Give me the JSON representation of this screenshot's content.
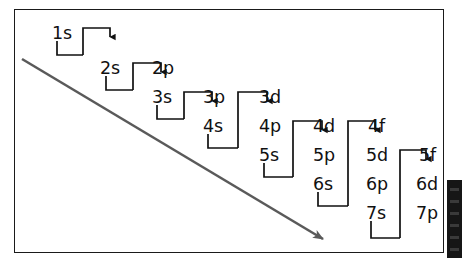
{
  "figure": {
    "kind": "aufbau-diagonal-rule-diagram",
    "frame": {
      "border_color": "#1a1a1a"
    },
    "background": "#ffffff",
    "diagonal_arrow": {
      "label": "order-of-filling-arrow",
      "color": "#5a5a5a",
      "start": [
        22,
        60
      ],
      "end": [
        330,
        243
      ]
    },
    "edge_bar": {
      "color": "#161616"
    }
  },
  "columns": [
    {
      "name": "diagonal-1",
      "x": 52,
      "top_y": 33,
      "orbitals": [
        "1s"
      ]
    },
    {
      "name": "diagonal-2",
      "x": 100,
      "top_y": 68,
      "orbitals": [
        "2s"
      ]
    },
    {
      "name": "diagonal-3",
      "x": 152,
      "top_y": 68,
      "orbitals": [
        "2p",
        "3s"
      ]
    },
    {
      "name": "diagonal-4",
      "x": 203,
      "top_y": 97,
      "orbitals": [
        "3p",
        "4s"
      ]
    },
    {
      "name": "diagonal-5",
      "x": 259,
      "top_y": 97,
      "orbitals": [
        "3d",
        "4p",
        "5s"
      ]
    },
    {
      "name": "diagonal-6",
      "x": 313,
      "top_y": 126,
      "orbitals": [
        "4d",
        "5p",
        "6s"
      ]
    },
    {
      "name": "diagonal-7",
      "x": 366,
      "top_y": 126,
      "orbitals": [
        "4f",
        "5d",
        "6p",
        "7s"
      ]
    },
    {
      "name": "diagonal-8",
      "x": 416,
      "top_y": 155,
      "orbitals": [
        "5f",
        "6d",
        "7p"
      ]
    }
  ],
  "orbital_labels": [
    {
      "id": "orb-1s",
      "text": "1s",
      "x": 52,
      "y": 33
    },
    {
      "id": "orb-2s",
      "text": "2s",
      "x": 100,
      "y": 68
    },
    {
      "id": "orb-2p",
      "text": "2p",
      "x": 152,
      "y": 68
    },
    {
      "id": "orb-3s",
      "text": "3s",
      "x": 152,
      "y": 97
    },
    {
      "id": "orb-3p",
      "text": "3p",
      "x": 203,
      "y": 97
    },
    {
      "id": "orb-4s",
      "text": "4s",
      "x": 203,
      "y": 126
    },
    {
      "id": "orb-3d",
      "text": "3d",
      "x": 259,
      "y": 97
    },
    {
      "id": "orb-4p",
      "text": "4p",
      "x": 259,
      "y": 126
    },
    {
      "id": "orb-5s",
      "text": "5s",
      "x": 259,
      "y": 155
    },
    {
      "id": "orb-4d",
      "text": "4d",
      "x": 313,
      "y": 126
    },
    {
      "id": "orb-5p",
      "text": "5p",
      "x": 313,
      "y": 155
    },
    {
      "id": "orb-6s",
      "text": "6s",
      "x": 313,
      "y": 184
    },
    {
      "id": "orb-4f",
      "text": "4f",
      "x": 366,
      "y": 126
    },
    {
      "id": "orb-5d",
      "text": "5d",
      "x": 366,
      "y": 155
    },
    {
      "id": "orb-6p",
      "text": "6p",
      "x": 366,
      "y": 184
    },
    {
      "id": "orb-7s",
      "text": "7s",
      "x": 366,
      "y": 213
    },
    {
      "id": "orb-5f",
      "text": "5f",
      "x": 416,
      "y": 155
    },
    {
      "id": "orb-6d",
      "text": "6d",
      "x": 416,
      "y": 184
    },
    {
      "id": "orb-7p",
      "text": "7p",
      "x": 416,
      "y": 213
    }
  ],
  "connectors": [
    {
      "id": "link-1s-2s",
      "from": "1s",
      "to": "2s"
    },
    {
      "id": "link-2s-2p",
      "from": "2s",
      "to": "2p"
    },
    {
      "id": "link-3s-3p",
      "from": "3s",
      "to": "3p"
    },
    {
      "id": "link-4s-3d",
      "from": "4s",
      "to": "3d"
    },
    {
      "id": "link-5s-4d",
      "from": "5s",
      "to": "4d"
    },
    {
      "id": "link-6s-4f",
      "from": "6s",
      "to": "4f"
    },
    {
      "id": "link-7s-5f",
      "from": "7s",
      "to": "5f"
    }
  ],
  "connector_style": {
    "color": "#111111",
    "stroke_width": 1.7
  }
}
